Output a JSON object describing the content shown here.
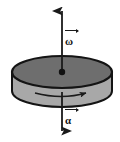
{
  "figure": {
    "background_color": "#ffffff",
    "canvas": {
      "width": 120,
      "height": 142
    },
    "artifact_text": ""
  },
  "labels": {
    "omega": {
      "glyph": "ω",
      "name": "angular-velocity",
      "vector": true
    },
    "alpha": {
      "glyph": "α",
      "name": "angular-acceleration",
      "vector": true
    }
  },
  "disk": {
    "name": "rotating-disk",
    "top_face_color": "#6e6e6e",
    "side_face_color": "#a8a8a8",
    "outline_color": "#141414",
    "center_x": 62,
    "center_y": 72,
    "radius_x": 50,
    "radius_y": 16,
    "thickness": 19
  },
  "axis": {
    "name": "rotation-axis",
    "color": "#1a1a1a",
    "x": 62,
    "top_y": 10,
    "bottom_y": 138,
    "double_headed": true
  },
  "spin_arrow": {
    "name": "rotation-direction-arrow",
    "color": "#1a1a1a",
    "start_x": 35,
    "end_x": 88,
    "y": 94,
    "direction": "clockwise-viewed-from-above"
  },
  "center_dot": {
    "name": "disk-center-point",
    "color": "#111111",
    "radius": 3
  }
}
